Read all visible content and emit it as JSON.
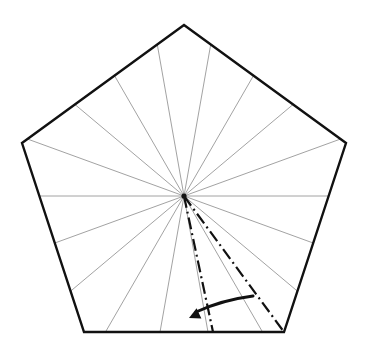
{
  "canvas": {
    "width": 365,
    "height": 348,
    "background": "#ffffff",
    "title": "pentagon-rotation-diagram"
  },
  "figure": {
    "name": "regular-pentagon-with-radial-fan-and-rotation-arrow",
    "shape": "pentagon",
    "sides": 5,
    "center": {
      "x": 184,
      "y": 196
    },
    "circumradius": 172,
    "outline_color": "#111111",
    "outline_width": 2.4,
    "fill": "#ffffff",
    "vertices": [
      {
        "label": "top",
        "x": 184,
        "y": 25
      },
      {
        "label": "right",
        "x": 346,
        "y": 143
      },
      {
        "label": "bottom-right",
        "x": 284,
        "y": 332
      },
      {
        "label": "bottom-left",
        "x": 84,
        "y": 332
      },
      {
        "label": "left",
        "x": 22,
        "y": 143
      }
    ]
  },
  "radial_fan": {
    "name": "radial-spoke-fan",
    "count": 18,
    "step_degrees": 20,
    "start_degrees": 0,
    "color": "#8a8a8a",
    "width": 0.8,
    "angles_degrees": [
      0,
      20,
      40,
      60,
      80,
      100,
      120,
      140,
      160,
      180,
      200,
      220,
      240,
      260,
      280,
      300,
      320,
      340
    ],
    "description": "Thin gray rays drawn from the pentagon center out to the boundary at 20 degree increments."
  },
  "dash_dot_rays": {
    "name": "rotation-reference-rays",
    "color": "#111111",
    "width": 2.2,
    "dash_pattern": "12 4 2 4",
    "rays": [
      {
        "label": "rotated-ray",
        "angle_degrees": 255,
        "end": {
          "x": 213,
          "y": 332
        }
      },
      {
        "label": "original-ray",
        "angle_degrees": 230,
        "end": {
          "x": 284,
          "y": 332
        }
      }
    ]
  },
  "rotation_arrow": {
    "name": "rotation-direction-arrow",
    "color": "#111111",
    "width": 3.0,
    "direction": "counterclockwise",
    "arc_start": {
      "x": 253,
      "y": 296
    },
    "arc_control": {
      "x": 222,
      "y": 300
    },
    "arc_end": {
      "x": 196,
      "y": 312
    },
    "arrow_tip": {
      "x": 189,
      "y": 318
    },
    "arrow_head_size": 11
  },
  "legend": {
    "items": [
      {
        "name": "pentagon-outline",
        "label": "Pentagon boundary",
        "color": "#111111"
      },
      {
        "name": "radial-spoke",
        "label": "Radial spoke",
        "color": "#8a8a8a"
      },
      {
        "name": "dash-dot-ray",
        "label": "Rotation reference ray",
        "color": "#111111"
      },
      {
        "name": "rotation-arrow",
        "label": "Rotation direction",
        "color": "#111111"
      }
    ]
  }
}
